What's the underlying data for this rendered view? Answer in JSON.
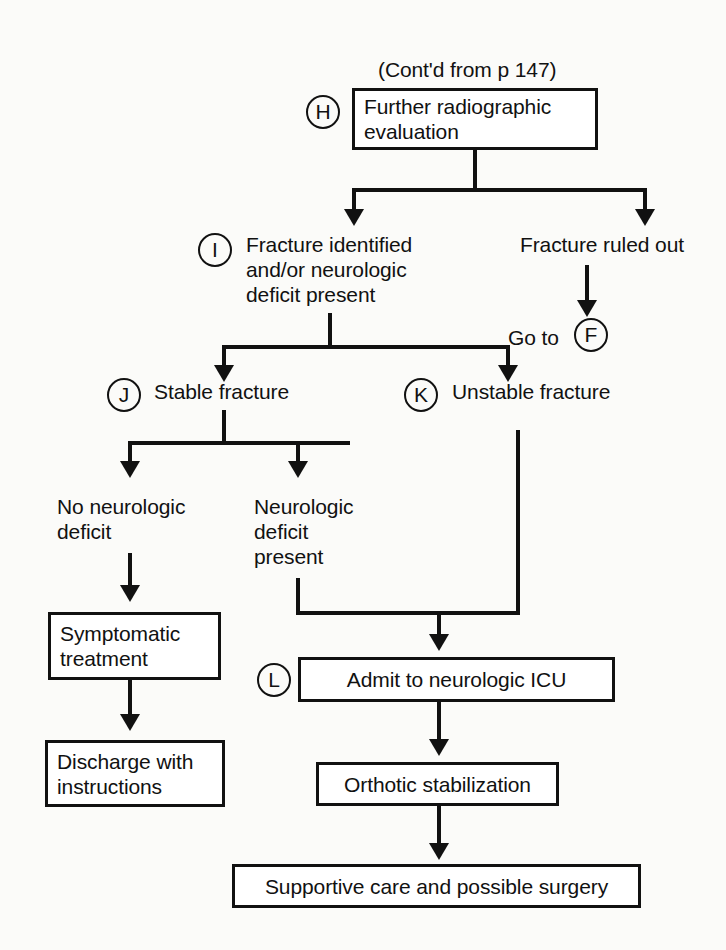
{
  "diagram": {
    "title_note": "(Cont'd from p 147)",
    "markers": {
      "h": "H",
      "i": "I",
      "j": "J",
      "k": "K",
      "l": "L",
      "f": "F"
    },
    "nodes": {
      "further_radiographic": "Further radiographic\nevaluation",
      "fracture_identified": "Fracture identified\nand/or neurologic\ndeficit present",
      "fracture_ruled_out": "Fracture ruled out",
      "go_to": "Go to",
      "stable_fracture": "Stable fracture",
      "unstable_fracture": "Unstable fracture",
      "no_neuro_deficit": "No neurologic\ndeficit",
      "neuro_deficit_present": "Neurologic\ndeficit\npresent",
      "symptomatic_treatment": "Symptomatic\ntreatment",
      "discharge_with_instructions": "Discharge with\ninstructions",
      "admit_icu": "Admit to neurologic ICU",
      "orthotic_stabilization": "Orthotic stabilization",
      "supportive_care": "Supportive care and possible surgery"
    },
    "colors": {
      "ink": "#111111",
      "paper": "#fbfbf9"
    }
  }
}
